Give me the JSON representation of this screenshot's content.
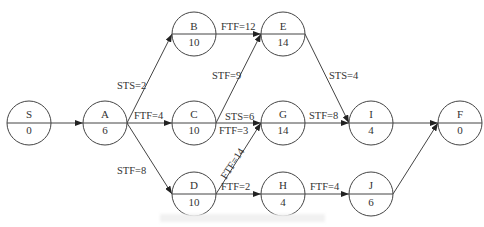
{
  "diagram": {
    "type": "precedence-network",
    "nodes": [
      {
        "id": "S",
        "name": "S",
        "duration": "0"
      },
      {
        "id": "A",
        "name": "A",
        "duration": "6"
      },
      {
        "id": "B",
        "name": "B",
        "duration": "10"
      },
      {
        "id": "C",
        "name": "C",
        "duration": "10"
      },
      {
        "id": "D",
        "name": "D",
        "duration": "10"
      },
      {
        "id": "E",
        "name": "E",
        "duration": "14"
      },
      {
        "id": "G",
        "name": "G",
        "duration": "14"
      },
      {
        "id": "H",
        "name": "H",
        "duration": "4"
      },
      {
        "id": "I",
        "name": "I",
        "duration": "4"
      },
      {
        "id": "J",
        "name": "J",
        "duration": "6"
      },
      {
        "id": "F",
        "name": "F",
        "duration": "0"
      }
    ],
    "edges": [
      {
        "from": "S",
        "to": "A",
        "label": ""
      },
      {
        "from": "A",
        "to": "B",
        "label": "STS=2"
      },
      {
        "from": "A",
        "to": "C",
        "label": "FTF=4"
      },
      {
        "from": "A",
        "to": "D",
        "label": "STF=8"
      },
      {
        "from": "B",
        "to": "E",
        "label": "FTF=12"
      },
      {
        "from": "C",
        "to": "E",
        "label": "STF=9"
      },
      {
        "from": "C",
        "to": "G",
        "label": "STS=6"
      },
      {
        "from": "C",
        "to": "G",
        "label2": "FTF=3"
      },
      {
        "from": "D",
        "to": "G",
        "label": "FTF=14"
      },
      {
        "from": "D",
        "to": "H",
        "label": "FTF=2"
      },
      {
        "from": "E",
        "to": "I",
        "label": "STS=4"
      },
      {
        "from": "G",
        "to": "I",
        "label": "STF=8"
      },
      {
        "from": "H",
        "to": "J",
        "label": "FTF=4"
      },
      {
        "from": "I",
        "to": "F",
        "label": ""
      },
      {
        "from": "J",
        "to": "F",
        "label": ""
      }
    ]
  }
}
